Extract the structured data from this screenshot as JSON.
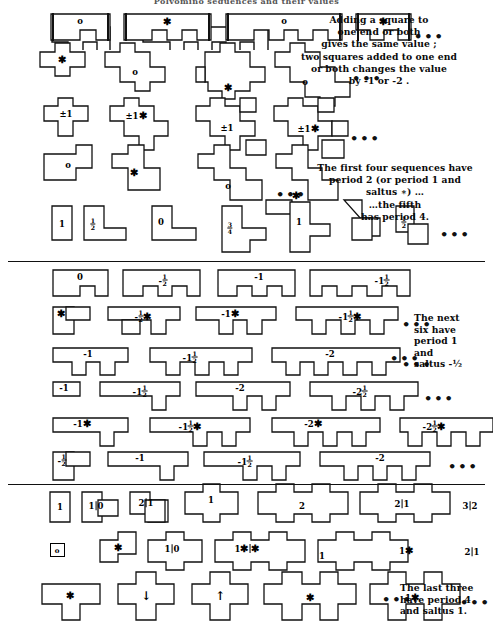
{
  "meta": {
    "title_fragment": "Polyomino sequences and their values",
    "ellipsis": "•••"
  },
  "notes": [
    {
      "id": "note-adding",
      "text": "Adding a square to\none end or both\ngives the same value ;\ntwo squares added to one end\nor both changes the value\nby  -1 or -2 ."
    },
    {
      "id": "note-period",
      "text": "The first four sequences have\nperiod 2 (or period 1 and\nsaltus ∗) …\n…the fifth\nhas period 4."
    },
    {
      "id": "note-next-six",
      "text": "The next\nsix have\nperiod 1\nand\nsaltus -½"
    },
    {
      "id": "note-last-three",
      "text": "The last three\nhave period 4\nand saltus 1."
    }
  ],
  "rows": [
    {
      "id": "row-1-bars",
      "labels": [
        "o",
        "∗",
        "o",
        "∗"
      ],
      "trailing_ellipsis": true
    },
    {
      "id": "row-2-plus",
      "labels": [
        "∗",
        "o",
        "∗",
        "o"
      ],
      "trailing_ellipsis": true
    },
    {
      "id": "row-3-pm1",
      "labels": [
        "±1",
        "±1∗",
        "±1",
        "±1∗"
      ],
      "trailing_ellipsis": true
    },
    {
      "id": "row-4-stair",
      "labels": [
        "o",
        "∗",
        "o",
        "∗"
      ],
      "trailing_ellipsis": true
    },
    {
      "id": "row-5-L",
      "labels": [
        "1",
        "½",
        "0",
        "¾",
        "1",
        "½"
      ],
      "trailing_ellipsis": true
    },
    {
      "id": "row-6-comb",
      "labels": [
        "0",
        "-½",
        "-1",
        "-1½"
      ],
      "trailing_ellipsis": false
    },
    {
      "id": "row-7-comb-star",
      "labels": [
        "∗",
        "-½∗",
        "-1∗",
        "-1½∗"
      ],
      "trailing_ellipsis": true
    },
    {
      "id": "row-8-teeth",
      "labels": [
        "-1",
        "-1½",
        "-2"
      ],
      "trailing_ellipsis": true
    },
    {
      "id": "row-9-teeth",
      "labels": [
        "-1",
        "-1½",
        "-2",
        "-2½"
      ],
      "trailing_ellipsis": true
    },
    {
      "id": "row-10-teeth-star",
      "labels": [
        "-1∗",
        "-1½∗",
        "-2∗",
        "-2½∗"
      ],
      "trailing_ellipsis": false
    },
    {
      "id": "row-11-steps",
      "labels": [
        "-½",
        "-1",
        "-1½",
        "-2"
      ],
      "trailing_ellipsis": true
    },
    {
      "id": "row-12-switch",
      "labels": [
        "1",
        "1|0",
        "2|1",
        "1",
        "2",
        "2|1",
        "3|2"
      ],
      "trailing_ellipsis": false
    },
    {
      "id": "row-13-switch-star",
      "labels": [
        "o",
        "∗",
        "1|0",
        "1∗|∗",
        "1",
        "1∗",
        "2|1"
      ],
      "trailing_ellipsis": false
    },
    {
      "id": "row-14-cross",
      "labels": [
        "∗",
        "↓",
        "↑",
        "∗",
        "1∗"
      ],
      "trailing_ellipsis": true
    }
  ]
}
